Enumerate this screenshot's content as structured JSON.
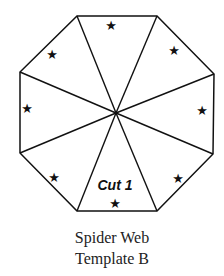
{
  "diagram": {
    "shape": "octagon",
    "segments": 8,
    "label": "Cut 1",
    "star_glyph": "★",
    "stroke_color": "#111111"
  },
  "caption": {
    "line1": "Spider Web",
    "line2": "Template B"
  }
}
